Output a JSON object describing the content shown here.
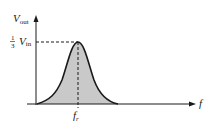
{
  "diagram": {
    "type": "frequency-response",
    "y_axis": {
      "label_main": "V",
      "label_sub": "out"
    },
    "x_axis": {
      "label": "f"
    },
    "peak_marker": {
      "value_fraction_num": "1",
      "value_fraction_den": "3",
      "value_main": "V",
      "value_sub": "in"
    },
    "center_marker": {
      "label_main": "f",
      "label_sub": "r"
    },
    "colors": {
      "curve": "#1a1a1a",
      "fill": "#c9c9c9",
      "axis": "#1a1a1a"
    }
  }
}
